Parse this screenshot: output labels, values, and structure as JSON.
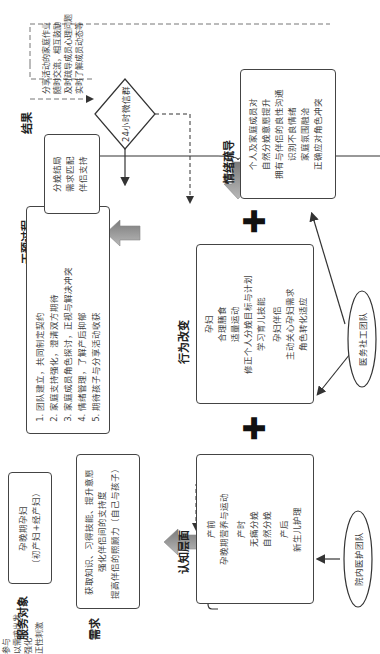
{
  "columns": {
    "service_target": "服务对象",
    "needs": "需求",
    "process": "干预过程",
    "result": "结果"
  },
  "service_target_box": {
    "line1": "孕晚期孕妇",
    "line2": "（初产妇+经产妇）"
  },
  "needs_box": {
    "lines": [
      "获取知识、习得技能、提升意愿",
      "强化伴侣间的支持度",
      "提高伴侣的照顾力（自己与孩子）"
    ]
  },
  "mate_diamond": {
    "label": "孕妇配偶",
    "arrow_participate": "参与",
    "arrow_needs": "以需求出发"
  },
  "process_box": {
    "steps": [
      "团队建立，共同制定契约",
      "家庭支持强化，澄清双方期待",
      "家庭成员角色探讨，正视与解决冲突",
      "情绪管理，了解产后抑郁",
      "期待孩子与分享活动收获"
    ]
  },
  "reinforce_label": "强化",
  "result_box": {
    "lines": [
      "分娩结局",
      "需求匹配",
      "伴侣支持"
    ]
  },
  "diamond_24h": {
    "label": "24小时微信群",
    "positive_stimulus": "正性刺激",
    "note_lines": [
      "分享活动的家庭作业",
      "随时交流，相互鼓励",
      "及时疏导成员心理问题",
      "实时了解成员动态等"
    ]
  },
  "cognitive": {
    "title": "认知层面",
    "groups": [
      [
        "产前",
        "孕晚期营养与运动"
      ],
      [
        "产时",
        "无痛分娩",
        "自然分娩"
      ],
      [
        "产后",
        "新生儿护理",
        "母乳喂养",
        "盆底功能康复"
      ]
    ]
  },
  "behavior": {
    "title": "行为改变",
    "groups": [
      [
        "孕妇",
        "合理膳食",
        "适量运动",
        "修正个人分娩目标与计划",
        "学习育儿技能"
      ],
      [
        "孕妇伴侣",
        "主动关心孕妇需求",
        "角色转化适应",
        "积极参与",
        "学习照顾伴侣及孩子"
      ]
    ]
  },
  "emotion": {
    "title": "情绪疏导",
    "lines": [
      "个人及家庭成员对",
      "自然分娩意愿提升",
      "拥有与伴侣的良性沟通",
      "识别不良情绪",
      "家庭氛围融洽",
      "正确应对角色冲突"
    ]
  },
  "teams": {
    "hospital_nursing": "院内医护团队",
    "medical_social_work": "医务社工团队"
  }
}
